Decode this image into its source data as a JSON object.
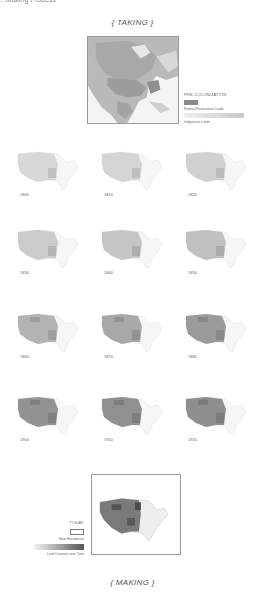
{
  "header": {
    "cut_text": "...Making Process"
  },
  "taking": {
    "title": "{ TAKING }",
    "legend": {
      "title": "PRE-COLONIZATION",
      "items": [
        {
          "label": "Federal Reservation Lands",
          "color": "#8a8a8a"
        },
        {
          "label": "Indigenous Lands",
          "color": "#dcdcdc"
        }
      ]
    }
  },
  "timeline": {
    "maps": [
      {
        "year": "1800",
        "shade": 0.12
      },
      {
        "year": "1810",
        "shade": 0.14
      },
      {
        "year": "1820",
        "shade": 0.16
      },
      {
        "year": "1830",
        "shade": 0.2
      },
      {
        "year": "1840",
        "shade": 0.24
      },
      {
        "year": "1850",
        "shade": 0.27
      },
      {
        "year": "1860",
        "shade": 0.35
      },
      {
        "year": "1870",
        "shade": 0.42
      },
      {
        "year": "1880",
        "shade": 0.5
      },
      {
        "year": "1900",
        "shade": 0.55
      },
      {
        "year": "1910",
        "shade": 0.57
      },
      {
        "year": "1920",
        "shade": 0.58
      }
    ]
  },
  "today": {
    "legend": {
      "title": "TODAY",
      "items": [
        {
          "label": "State Boundaries"
        },
        {
          "label": "Land Cessions over Time"
        }
      ]
    }
  },
  "making": {
    "title": "{ MAKING }"
  }
}
